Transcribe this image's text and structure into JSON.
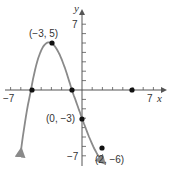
{
  "chart_data": {
    "type": "line",
    "title": "",
    "xlabel": "x",
    "ylabel": "y",
    "xlim": [
      -7,
      7
    ],
    "ylim": [
      -7,
      7
    ],
    "x_tick_labels": [
      "-7",
      "7"
    ],
    "y_tick_labels": [
      "7",
      "-7"
    ],
    "grid": false,
    "curve": "cubic through (-5,0), (-1,0), (5,0) with turning points near (-3,5) and (2,-6), arrows at both ends",
    "x_intercepts": [
      -5,
      -1,
      5
    ],
    "points": [
      {
        "x": -3,
        "y": 5,
        "label": "(−3, 5)"
      },
      {
        "x": 0,
        "y": -3,
        "label": "(0, −3)"
      },
      {
        "x": 2,
        "y": -6,
        "label": "(2, −6)"
      },
      {
        "x": -5,
        "y": 0,
        "label": ""
      },
      {
        "x": -1,
        "y": 0,
        "label": ""
      },
      {
        "x": 5,
        "y": 0,
        "label": ""
      }
    ],
    "colors": {
      "curve": "#8a8a8a",
      "axes": "#555555",
      "points": "#111111"
    }
  },
  "labels": {
    "x_axis": "x",
    "y_axis": "y",
    "x_min": "−7",
    "x_max": "7",
    "y_max": "7",
    "y_min": "−7",
    "p1": "(−3, 5)",
    "p2": "(0, −3)",
    "p3": "(2, −6)"
  }
}
